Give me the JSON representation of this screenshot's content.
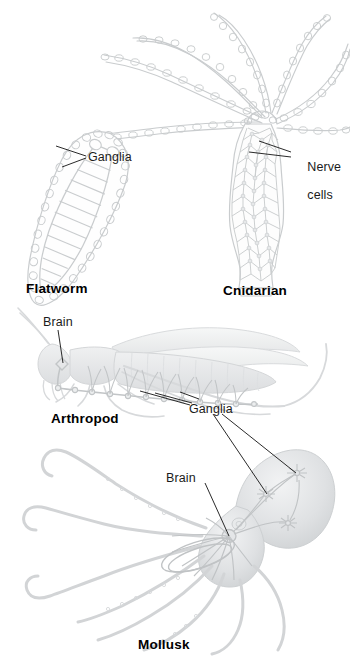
{
  "figure": {
    "background_color": "#ffffff",
    "artwork_color": "#c9ccce",
    "leader_line_color": "#1f1f1f",
    "label_text_color": "#1b1b1b",
    "caption_text_color": "#000000"
  },
  "labels": {
    "ganglia_flatworm": "Ganglia",
    "nerve_cells_line1": "Nerve",
    "nerve_cells_line2": "cells",
    "brain_arthropod": "Brain",
    "ganglia_shared": "Ganglia",
    "brain_mollusk": "Brain"
  },
  "captions": {
    "flatworm": "Flatworm",
    "cnidarian": "Cnidarian",
    "arthropod": "Arthropod",
    "mollusk": "Mollusk"
  },
  "organisms": [
    {
      "caption": "Flatworm",
      "structure": "ladder-like nerve cords with paired anterior ganglia",
      "labels": [
        "Ganglia"
      ]
    },
    {
      "caption": "Cnidarian",
      "structure": "diffuse nerve net throughout body and tentacles",
      "labels": [
        "Nerve cells"
      ]
    },
    {
      "caption": "Arthropod",
      "structure": "brain with ventral nerve cord and segmental ganglia",
      "labels": [
        "Brain",
        "Ganglia"
      ]
    },
    {
      "caption": "Mollusk",
      "structure": "large brain with nerve ring and peripheral ganglia",
      "labels": [
        "Brain",
        "Ganglia"
      ]
    }
  ]
}
